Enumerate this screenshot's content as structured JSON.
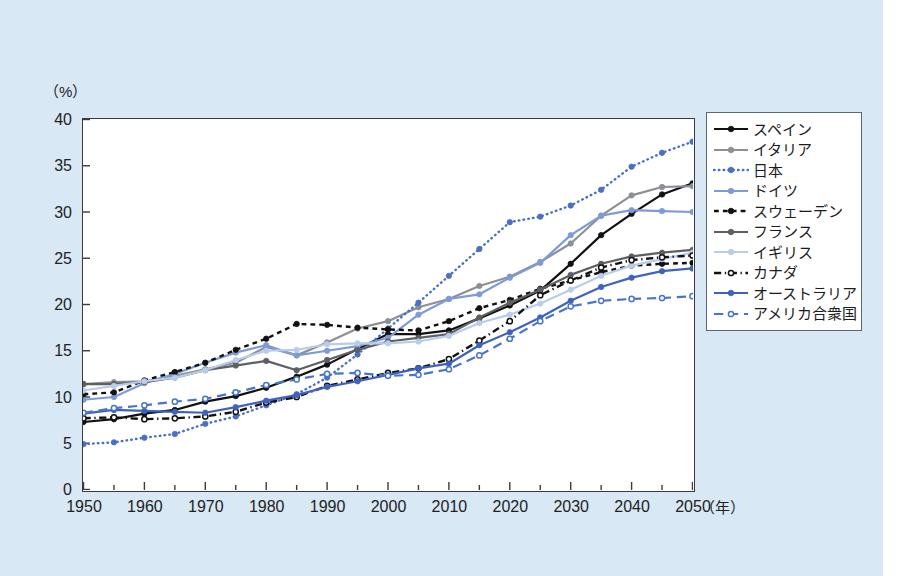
{
  "axis": {
    "y_unit": "（%）",
    "x_unit": "（年）",
    "y_ticks": [
      "40",
      "35",
      "30",
      "25",
      "20",
      "15",
      "10",
      "5",
      "0"
    ],
    "x_ticks": [
      "1950",
      "1960",
      "1970",
      "1980",
      "1990",
      "2000",
      "2010",
      "2020",
      "2030",
      "2040",
      "2050"
    ]
  },
  "colors": {
    "background": "#d9e8f5",
    "plot_bg": "#ffffff",
    "frame": "#3a3a3a",
    "spain": "#111111",
    "italy": "#8b8f96",
    "japan": "#4a6fc4",
    "germany": "#7d9bd8",
    "sweden": "#111111",
    "france": "#5d5f63",
    "uk": "#b9cdea",
    "canada": "#111111",
    "australia": "#3f63bd",
    "usa": "#4a74c9"
  },
  "legend": {
    "items": [
      {
        "label": "スペイン",
        "key": "spain",
        "dash": "none",
        "color": "#111111",
        "width": 2.2,
        "marker": "filled"
      },
      {
        "label": "イタリア",
        "key": "italy",
        "dash": "none",
        "color": "#8b8f96",
        "width": 2.2,
        "marker": "filled"
      },
      {
        "label": "日本",
        "key": "japan",
        "dash": "dotted",
        "color": "#4a6fc4",
        "width": 2.4,
        "marker": "filled"
      },
      {
        "label": "ドイツ",
        "key": "germany",
        "dash": "none",
        "color": "#7d9bd8",
        "width": 2.2,
        "marker": "filled"
      },
      {
        "label": "スウェーデン",
        "key": "sweden",
        "dash": "dashed",
        "color": "#111111",
        "width": 2.4,
        "marker": "filled"
      },
      {
        "label": "フランス",
        "key": "france",
        "dash": "none",
        "color": "#5d5f63",
        "width": 2.2,
        "marker": "filled"
      },
      {
        "label": "イギリス",
        "key": "uk",
        "dash": "none",
        "color": "#b9cdea",
        "width": 2.2,
        "marker": "filled"
      },
      {
        "label": "カナダ",
        "key": "canada",
        "dash": "dashdot",
        "color": "#111111",
        "width": 2.4,
        "marker": "open"
      },
      {
        "label": "オーストラリア",
        "key": "australia",
        "dash": "none",
        "color": "#3f63bd",
        "width": 2.2,
        "marker": "filled"
      },
      {
        "label": "アメリカ合衆国",
        "key": "usa",
        "dash": "longdash",
        "color": "#4a74c9",
        "width": 2.2,
        "marker": "open"
      }
    ]
  },
  "chart_data": {
    "type": "line",
    "title": "",
    "xlabel": "（年）",
    "ylabel": "（%）",
    "xlim": [
      1950,
      2050
    ],
    "ylim": [
      0,
      40
    ],
    "grid": false,
    "legend_position": "right-outside",
    "x": [
      1950,
      1955,
      1960,
      1965,
      1970,
      1975,
      1980,
      1985,
      1990,
      1995,
      2000,
      2005,
      2010,
      2015,
      2020,
      2025,
      2030,
      2035,
      2040,
      2045,
      2050
    ],
    "series": [
      {
        "name": "スペイン",
        "key": "spain",
        "values": [
          7.3,
          7.6,
          8.2,
          8.6,
          9.5,
          10.1,
          11.0,
          12.2,
          13.5,
          15.2,
          16.8,
          16.8,
          17.2,
          18.5,
          19.9,
          21.5,
          24.4,
          27.5,
          29.8,
          31.9,
          33.1
        ]
      },
      {
        "name": "イタリア",
        "key": "italy",
        "values": [
          11.4,
          11.6,
          11.7,
          12.3,
          13.0,
          13.7,
          15.4,
          14.5,
          15.9,
          17.4,
          18.2,
          19.7,
          20.6,
          22.0,
          23.0,
          24.6,
          26.6,
          29.6,
          31.8,
          32.7,
          32.8
        ]
      },
      {
        "name": "日本",
        "key": "japan",
        "values": [
          4.9,
          5.1,
          5.6,
          6.0,
          7.1,
          7.9,
          9.1,
          10.3,
          12.1,
          14.6,
          17.4,
          20.2,
          23.1,
          26.0,
          28.9,
          29.5,
          30.7,
          32.4,
          34.9,
          36.4,
          37.6
        ]
      },
      {
        "name": "ドイツ",
        "key": "germany",
        "values": [
          9.7,
          10.0,
          11.5,
          12.5,
          13.7,
          14.8,
          15.6,
          14.5,
          15.0,
          15.5,
          16.4,
          18.9,
          20.6,
          21.1,
          22.9,
          24.5,
          27.5,
          29.6,
          30.2,
          30.1,
          30.0
        ]
      },
      {
        "name": "スウェーデン",
        "key": "sweden",
        "values": [
          10.3,
          10.5,
          11.8,
          12.7,
          13.7,
          15.1,
          16.3,
          17.9,
          17.8,
          17.5,
          17.3,
          17.2,
          18.2,
          19.6,
          20.5,
          21.7,
          22.6,
          23.5,
          24.2,
          24.4,
          24.5
        ]
      },
      {
        "name": "フランス",
        "key": "france",
        "values": [
          11.4,
          11.4,
          11.6,
          12.1,
          12.9,
          13.4,
          13.9,
          12.9,
          14.0,
          15.1,
          16.0,
          16.4,
          16.8,
          18.6,
          20.2,
          21.6,
          23.2,
          24.4,
          25.2,
          25.6,
          25.9
        ]
      },
      {
        "name": "イギリス",
        "key": "uk",
        "values": [
          10.7,
          11.2,
          11.7,
          12.1,
          12.9,
          14.0,
          15.0,
          15.1,
          15.7,
          15.8,
          15.8,
          16.0,
          16.6,
          18.0,
          18.9,
          20.1,
          21.6,
          23.1,
          24.2,
          24.9,
          25.6
        ]
      },
      {
        "name": "カナダ",
        "key": "canada",
        "values": [
          7.7,
          7.8,
          7.6,
          7.7,
          7.9,
          8.4,
          9.4,
          10.0,
          11.2,
          11.9,
          12.6,
          13.1,
          14.1,
          16.1,
          18.2,
          21.0,
          22.6,
          24.0,
          24.8,
          25.1,
          25.3
        ]
      },
      {
        "name": "オーストラリア",
        "key": "australia",
        "values": [
          8.2,
          8.6,
          8.5,
          8.4,
          8.3,
          8.9,
          9.6,
          10.2,
          11.1,
          11.7,
          12.4,
          13.1,
          13.6,
          15.6,
          17.0,
          18.6,
          20.4,
          21.9,
          22.9,
          23.6,
          23.9
        ]
      },
      {
        "name": "アメリカ合衆国",
        "key": "usa",
        "values": [
          8.3,
          8.8,
          9.1,
          9.5,
          9.8,
          10.5,
          11.3,
          11.9,
          12.5,
          12.6,
          12.3,
          12.4,
          13.0,
          14.5,
          16.3,
          18.2,
          19.8,
          20.4,
          20.6,
          20.7,
          20.9
        ]
      }
    ]
  }
}
